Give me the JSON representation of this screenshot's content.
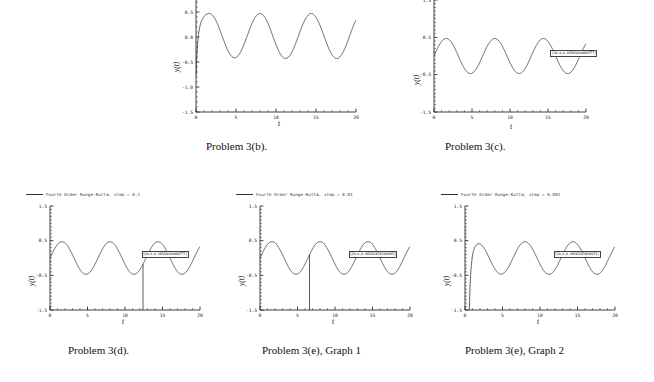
{
  "figure": {
    "title": "",
    "captions": [
      {
        "id": "cap-3b",
        "text": "Problem 3(b)."
      },
      {
        "id": "cap-3c",
        "text": "Problem 3(c)."
      },
      {
        "id": "cap-3d",
        "text": "Problem 3(d)."
      },
      {
        "id": "cap-3e1",
        "text": "Problem 3(e), Graph 1"
      },
      {
        "id": "cap-3e2",
        "text": "Problem 3(e), Graph 2"
      }
    ]
  },
  "axis_common": {
    "xlabel": "t",
    "ylabel": "y(t)",
    "xticks": [
      "0",
      "5",
      "10",
      "15",
      "20"
    ],
    "xtick_values": [
      0,
      5,
      10,
      15,
      20
    ],
    "xlim": [
      0,
      20
    ],
    "yticks_full": [
      "1.5",
      "0.5",
      "-0.5",
      "-1.5"
    ],
    "ytick_values_full": [
      1.5,
      0.5,
      -0.5,
      -1.5
    ],
    "yticks_cropped": [
      "1.0",
      "0.5",
      "0.0",
      "-0.5",
      "-1.0",
      "-1.5"
    ],
    "ytick_values_cropped": [
      1.0,
      0.5,
      0.0,
      -0.5,
      -1.0,
      -1.5
    ],
    "ylim": [
      -1.5,
      1.5
    ],
    "grid": false,
    "minor_ticks": true
  },
  "chart_data": [
    {
      "id": "chart-3b",
      "type": "line",
      "title": "Problem 3(b).",
      "xlabel": "t",
      "ylabel": "y(t)",
      "xlim": [
        0,
        20
      ],
      "ylim": [
        -1.5,
        1.3
      ],
      "xticks": [
        0,
        5,
        10,
        15,
        20
      ],
      "yticks": [
        1.0,
        0.5,
        0.0,
        -0.5,
        -1.0,
        -1.5
      ],
      "grid": false,
      "cropped_top": true,
      "legend": null,
      "series": [
        {
          "name": "exact solution",
          "comment": "damped-forced oscillation, steady amplitude ~0.45",
          "kind": "oscillatory",
          "amplitude": 0.45,
          "offset": 0.02,
          "period": 6.4,
          "phase": 1.6,
          "decay": 0.0,
          "start_transient": true
        },
        {
          "name": "unstable numerical solution",
          "comment": "blows up periodically; vertical asymptote-like spikes near t=1,5,10,15,19",
          "kind": "blowup",
          "asymptotes": [
            1.0,
            5.2,
            10.2,
            15.2,
            19.4
          ],
          "amplitude": 0.45,
          "period": 6.4,
          "phase": 1.6
        }
      ]
    },
    {
      "id": "chart-3c",
      "type": "line",
      "title": "Problem 3(c).",
      "xlabel": "t",
      "ylabel": "y(t)",
      "xlim": [
        0,
        20
      ],
      "ylim": [
        -1.5,
        1.5
      ],
      "xticks": [
        0,
        5,
        10,
        15,
        20
      ],
      "yticks": [
        1.5,
        0.5,
        -0.5,
        -1.5
      ],
      "grid": false,
      "legend": null,
      "annotation": {
        "text": "[20.0,0.345820100894777]",
        "x": 15.3,
        "y": 0.17
      },
      "series": [
        {
          "name": "stable solution",
          "kind": "oscillatory",
          "amplitude": 0.47,
          "offset": 0.0,
          "period": 6.4,
          "phase": 1.6,
          "decay": 0.0,
          "start_transient": false
        }
      ]
    },
    {
      "id": "chart-3d",
      "type": "line",
      "title": "Problem 3(d).",
      "xlabel": "t",
      "ylabel": "y(t)",
      "xlim": [
        0,
        20
      ],
      "ylim": [
        -1.5,
        1.5
      ],
      "xticks": [
        0,
        5,
        10,
        15,
        20
      ],
      "yticks": [
        1.5,
        0.5,
        -0.5,
        -1.5
      ],
      "grid": false,
      "legend": "Fourth Order Runge-Kutta, step = 0.1",
      "annotation": {
        "text": "[20.0,0.345820100894777]",
        "x": 12.2,
        "y": 0.2
      },
      "series": [
        {
          "name": "RK4 step 0.1",
          "kind": "oscillatory-with-drop",
          "amplitude": 0.47,
          "offset": 0.0,
          "period": 6.4,
          "phase": 1.6,
          "drop_at": 12.4,
          "start_transient": false
        }
      ]
    },
    {
      "id": "chart-3e1",
      "type": "line",
      "title": "Problem 3(e), Graph 1",
      "xlabel": "t",
      "ylabel": "y(t)",
      "xlim": [
        0,
        20
      ],
      "ylim": [
        -1.5,
        1.5
      ],
      "xticks": [
        0,
        5,
        10,
        15,
        20
      ],
      "yticks": [
        1.5,
        0.5,
        -0.5,
        -1.5
      ],
      "grid": false,
      "legend": "Fourth Order Runge-Kutta, step = 0.01",
      "annotation": {
        "text": "[20.0,0.3458218741184195]",
        "x": 11.8,
        "y": 0.2
      },
      "series": [
        {
          "name": "RK4 step 0.01",
          "kind": "oscillatory-with-drop",
          "amplitude": 0.47,
          "offset": 0.0,
          "period": 6.4,
          "phase": 1.6,
          "drop_at": 6.6,
          "start_transient": false
        }
      ]
    },
    {
      "id": "chart-3e2",
      "type": "line",
      "title": "Problem 3(e), Graph 2",
      "xlabel": "t",
      "ylabel": "y(t)",
      "xlim": [
        0,
        20
      ],
      "ylim": [
        -1.5,
        1.5
      ],
      "xticks": [
        0,
        5,
        10,
        15,
        20
      ],
      "yticks": [
        1.5,
        0.5,
        -0.5,
        -1.5
      ],
      "grid": false,
      "legend": "Fourth Order Runge-Kutta, step = 0.001",
      "annotation": {
        "text": "[20.0,0.345821874818673]",
        "x": 11.8,
        "y": 0.2
      },
      "series": [
        {
          "name": "RK4 step 0.001",
          "kind": "oscillatory-rise",
          "amplitude": 0.47,
          "offset": 0.0,
          "period": 6.4,
          "phase": 1.6,
          "rise_at": 0.55,
          "start_transient": true
        }
      ]
    }
  ]
}
